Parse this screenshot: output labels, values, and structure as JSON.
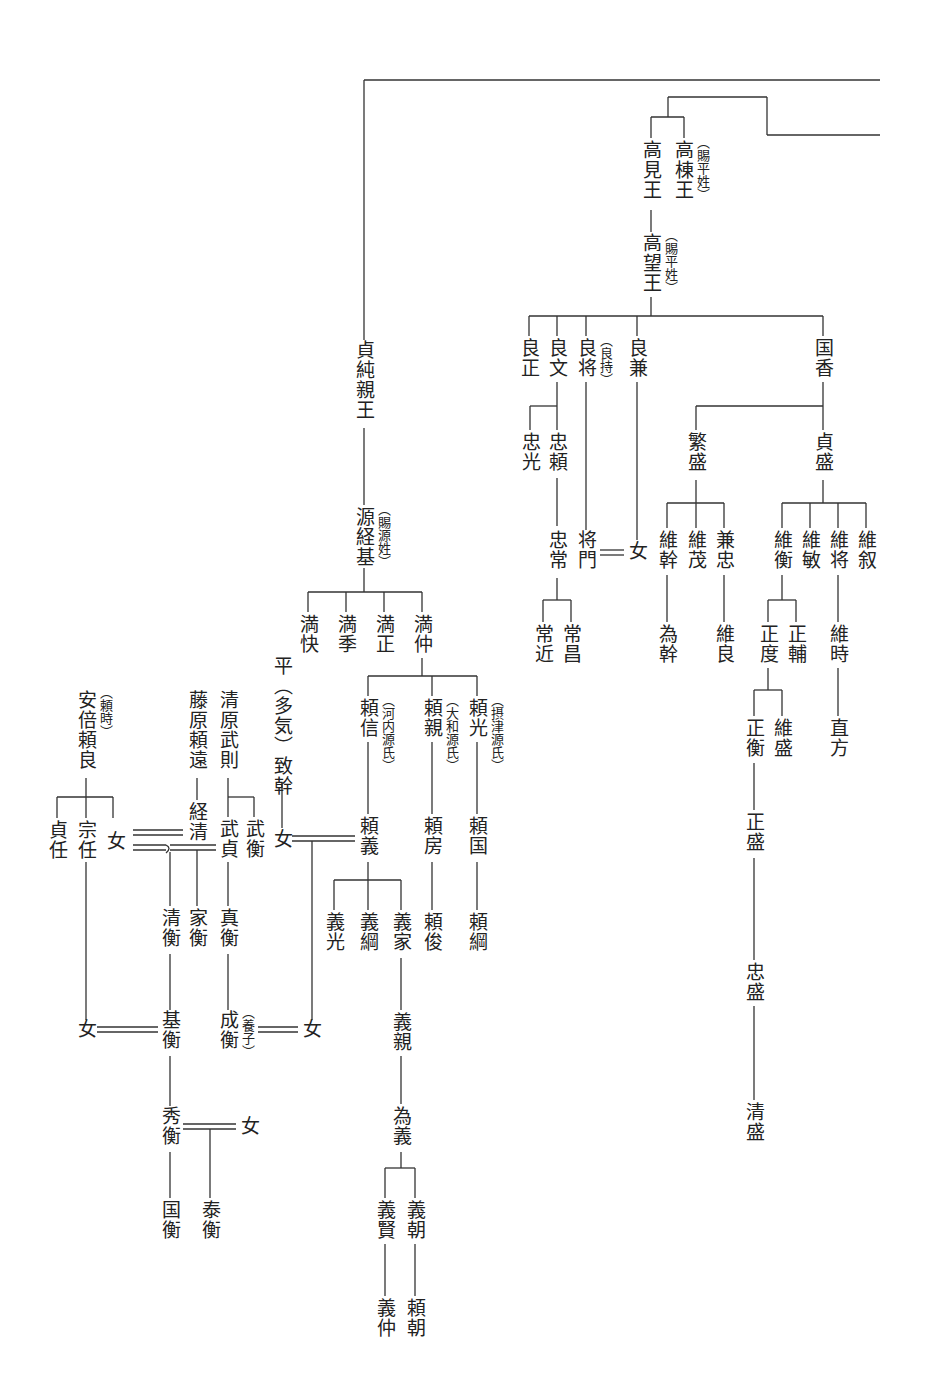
{
  "diagram": {
    "type": "genealogy",
    "nodes": {
      "takamune": {
        "name": "高棟王",
        "note": "（賜平姓）"
      },
      "takami": {
        "name": "高見王"
      },
      "takamochi": {
        "name": "高望王",
        "note": "（賜平姓）"
      },
      "yoshimasa": {
        "name": "良正"
      },
      "yoshifumi": {
        "name": "良文"
      },
      "yoshimasa2": {
        "name": "良将",
        "note": "（良持）"
      },
      "yoshikane": {
        "name": "良兼"
      },
      "kunika": {
        "name": "国香"
      },
      "tadamitsu": {
        "name": "忠光"
      },
      "tadayori": {
        "name": "忠頼"
      },
      "tadatsune": {
        "name": "忠常"
      },
      "masakado": {
        "name": "将門"
      },
      "onna_yoshikane": {
        "name": "女"
      },
      "tsunechika": {
        "name": "常近"
      },
      "tsunemasa": {
        "name": "常昌"
      },
      "shigemori": {
        "name": "繁盛"
      },
      "sadamori": {
        "name": "貞盛"
      },
      "koremoto": {
        "name": "維幹"
      },
      "koreshige": {
        "name": "維茂"
      },
      "kanetada": {
        "name": "兼忠"
      },
      "tamemoto": {
        "name": "為幹"
      },
      "koreyoshi": {
        "name": "維良"
      },
      "korehira": {
        "name": "維衡"
      },
      "koretoshi": {
        "name": "維敏"
      },
      "koremasa": {
        "name": "維将"
      },
      "korenobu": {
        "name": "維叙"
      },
      "masanori": {
        "name": "正度"
      },
      "masasuke": {
        "name": "正輔"
      },
      "koretoki": {
        "name": "維時"
      },
      "masahira": {
        "name": "正衡"
      },
      "koremori": {
        "name": "維盛"
      },
      "naokata": {
        "name": "直方"
      },
      "masamori": {
        "name": "正盛"
      },
      "tadamori": {
        "name": "忠盛"
      },
      "kiyomori": {
        "name": "清盛"
      },
      "sadazumi": {
        "name": "貞純親王"
      },
      "tsunemoto": {
        "name": "源経基",
        "note": "（賜源姓）"
      },
      "mitsuyoshi": {
        "name": "満快"
      },
      "mitsusue": {
        "name": "満季"
      },
      "mitsumasa": {
        "name": "満正"
      },
      "mitsunaka": {
        "name": "満仲"
      },
      "munemoto": {
        "name": "平（多気）致幹"
      },
      "yorinobu": {
        "name": "頼信",
        "note": "（河内源氏）"
      },
      "yorichika": {
        "name": "頼親",
        "note": "（大和源氏）"
      },
      "yorimitsu": {
        "name": "頼光",
        "note": "（摂津源氏）"
      },
      "onna_munemoto": {
        "name": "女"
      },
      "yoriyoshi": {
        "name": "頼義"
      },
      "yorifusa": {
        "name": "頼房"
      },
      "yorikuni": {
        "name": "頼国"
      },
      "yoshimitsu": {
        "name": "義光"
      },
      "yoshitsuna": {
        "name": "義綱"
      },
      "yoshiie": {
        "name": "義家"
      },
      "yoritoshi": {
        "name": "頼俊"
      },
      "yoritsuna": {
        "name": "頼綱"
      },
      "yoshichika": {
        "name": "義親"
      },
      "tameyoshi": {
        "name": "為義"
      },
      "yoshikata": {
        "name": "義賢"
      },
      "yoshitomo": {
        "name": "義朝"
      },
      "yoshinaka": {
        "name": "義仲"
      },
      "yoritomo": {
        "name": "頼朝"
      },
      "abe_yoritoki": {
        "name": "安倍頼良",
        "note": "（頼時）"
      },
      "fujiwara_yoritoo": {
        "name": "藤原頼遠"
      },
      "kiyohara_takenori": {
        "name": "清原武則"
      },
      "sadato": {
        "name": "貞任"
      },
      "muneto": {
        "name": "宗任"
      },
      "onna_abe": {
        "name": "女"
      },
      "tsunekiyo": {
        "name": "経清"
      },
      "takesada": {
        "name": "武貞"
      },
      "takehira": {
        "name": "武衡"
      },
      "kiyohira": {
        "name": "清衡"
      },
      "iehira": {
        "name": "家衡"
      },
      "sanehira": {
        "name": "真衡"
      },
      "onna_muneto": {
        "name": "女"
      },
      "motohira": {
        "name": "基衡"
      },
      "narihira": {
        "name": "成衡",
        "note": "（養子）"
      },
      "onna_yoshiie": {
        "name": "女"
      },
      "hidehira": {
        "name": "秀衡"
      },
      "onna_hidehira": {
        "name": "女"
      },
      "kunihira": {
        "name": "国衡"
      },
      "yasuhira": {
        "name": "泰衡"
      }
    }
  }
}
